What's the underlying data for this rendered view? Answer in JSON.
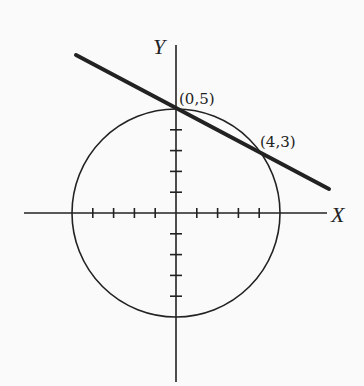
{
  "diagram": {
    "colors": {
      "background": "#fafafa",
      "ink": "#222222"
    },
    "axes": {
      "x_label": "X",
      "y_label": "Y",
      "x_ticks": [
        -4,
        -3,
        -2,
        -1,
        1,
        2,
        3,
        4
      ],
      "y_ticks": [
        -4,
        -3,
        -2,
        -1,
        1,
        2,
        3,
        4
      ]
    },
    "circle": {
      "center": [
        0,
        0
      ],
      "radius": 5
    },
    "line": {
      "description": "secant through (0,5) and (4,3)",
      "slope": -0.5,
      "intercept": 5
    },
    "points": [
      {
        "label": "(0,5)",
        "x": 0,
        "y": 5
      },
      {
        "label": "(4,3)",
        "x": 4,
        "y": 3
      }
    ]
  }
}
